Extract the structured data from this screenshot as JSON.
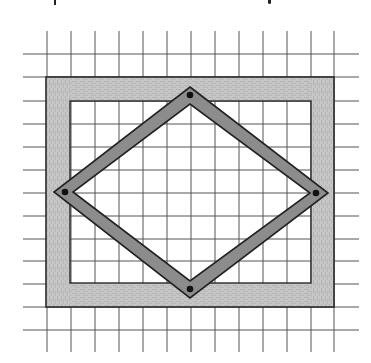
{
  "figure": {
    "type": "diagram",
    "colors": {
      "background": "#ffffff",
      "grid_line": "#555555",
      "frame_fill": "#c4c4c4",
      "frame_outline": "#2a2a2a",
      "bar_fill": "#8c8c8c",
      "bar_outline": "#222222",
      "pin": "#111111"
    },
    "grid": {
      "vertical_x": [
        47,
        71,
        95,
        119,
        143,
        167,
        191,
        215,
        239,
        263,
        287,
        311,
        334
      ],
      "horizontal_y": [
        54,
        77,
        101,
        124,
        147,
        170,
        193,
        216,
        239,
        261,
        284,
        307,
        330
      ],
      "x_extent": [
        23,
        359
      ],
      "y_extent": [
        31,
        352
      ]
    },
    "frame": {
      "outer": {
        "x": 46,
        "y": 77,
        "w": 288,
        "h": 230
      },
      "inner": {
        "x": 70,
        "y": 101,
        "w": 241,
        "h": 182
      }
    },
    "diamond": {
      "outer": [
        [
          190,
          87
        ],
        [
          328,
          193
        ],
        [
          190,
          298
        ],
        [
          54,
          192
        ]
      ],
      "inner": [
        [
          190,
          104
        ],
        [
          310,
          193
        ],
        [
          190,
          281
        ],
        [
          73,
          192
        ]
      ],
      "pins": [
        [
          190,
          95
        ],
        [
          316,
          193
        ],
        [
          190,
          289
        ],
        [
          65,
          192
        ]
      ]
    }
  }
}
